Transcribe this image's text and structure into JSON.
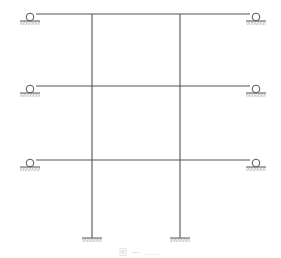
{
  "diagram": {
    "type": "structural-frame",
    "stroke_color": "#555555",
    "hatch_color": "#888888",
    "beams_y": [
      14,
      86,
      160
    ],
    "beam_x_start": 36,
    "beam_x_end": 250,
    "columns_x": [
      92,
      180
    ],
    "column_top_y": 14,
    "column_bottom_y": 238,
    "roller_supports": [
      {
        "x": 30,
        "y": 14,
        "side": "left"
      },
      {
        "x": 256,
        "y": 14,
        "side": "right"
      },
      {
        "x": 30,
        "y": 86,
        "side": "left"
      },
      {
        "x": 256,
        "y": 86,
        "side": "right"
      },
      {
        "x": 30,
        "y": 160,
        "side": "left"
      },
      {
        "x": 256,
        "y": 160,
        "side": "right"
      }
    ],
    "fixed_supports": [
      {
        "x": 92,
        "y": 238
      },
      {
        "x": 180,
        "y": 238
      }
    ]
  },
  "caption": {
    "text": "图 — ……"
  }
}
